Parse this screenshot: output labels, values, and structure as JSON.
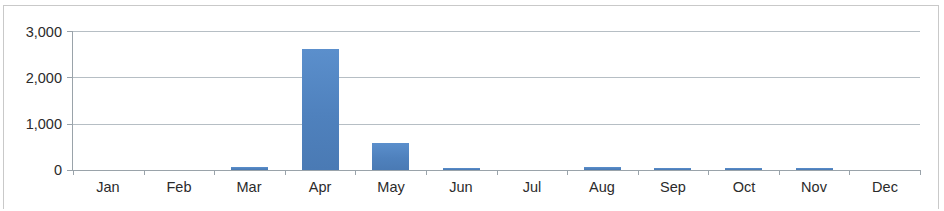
{
  "chart_data": {
    "type": "bar",
    "title": "",
    "subtitle": "",
    "xlabel": "",
    "ylabel": "",
    "categories": [
      "Jan",
      "Feb",
      "Mar",
      "Apr",
      "May",
      "Jun",
      "Jul",
      "Aug",
      "Sep",
      "Oct",
      "Nov",
      "Dec"
    ],
    "values": [
      0,
      0,
      55,
      2620,
      580,
      45,
      0,
      60,
      50,
      45,
      40,
      0
    ],
    "series": [
      {
        "name": "",
        "values": [
          0,
          0,
          55,
          2620,
          580,
          45,
          0,
          60,
          50,
          45,
          40,
          0
        ],
        "color": "#4F81BD"
      }
    ],
    "ylim": [
      0,
      3000
    ],
    "ytick_values": [
      0,
      1000,
      2000,
      3000
    ],
    "ytick_labels": [
      "0",
      "1,000",
      "2,000",
      "3,000"
    ],
    "grid": true,
    "grid_axis": "y",
    "legend": false,
    "legend_position": "none",
    "colors": {
      "bar": "#4F81BD",
      "gridline": "#B6BEC4",
      "axis": "#9AA3AA",
      "text": "#2B2B2B",
      "background": "#FFFFFF",
      "frame_border": "#C9C9C9"
    }
  }
}
